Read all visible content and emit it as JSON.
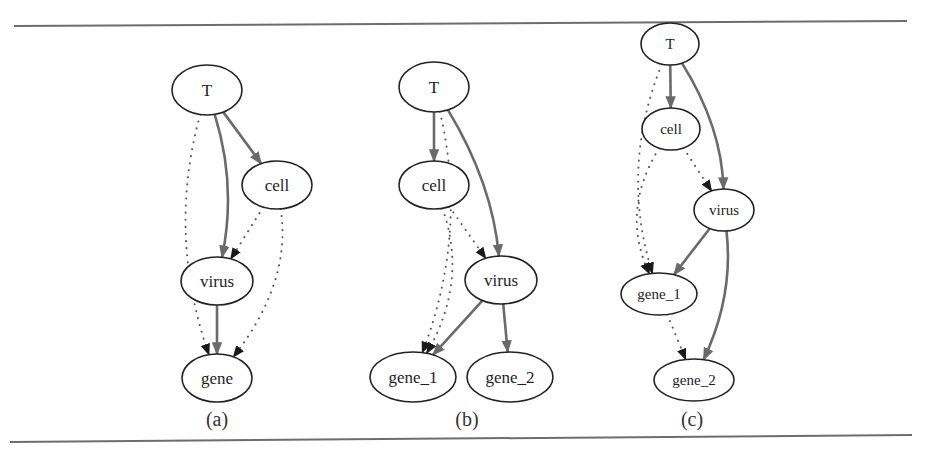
{
  "figure": {
    "panels": [
      {
        "id": "a",
        "caption": "(a)",
        "caption_pos": [
          217,
          426
        ],
        "nodes": [
          {
            "id": "T",
            "label": "T",
            "cx": 207,
            "cy": 90,
            "rx": 35,
            "ry": 25,
            "font": 17
          },
          {
            "id": "cell",
            "label": "cell",
            "cx": 277,
            "cy": 185,
            "rx": 35,
            "ry": 24,
            "font": 17
          },
          {
            "id": "virus",
            "label": "virus",
            "cx": 217,
            "cy": 281,
            "rx": 36,
            "ry": 24,
            "font": 17
          },
          {
            "id": "gene",
            "label": "gene",
            "cx": 217,
            "cy": 378,
            "rx": 35,
            "ry": 24,
            "font": 17
          }
        ],
        "edges": [
          {
            "from": "T",
            "to": "virus",
            "style": "solid"
          },
          {
            "from": "T",
            "to": "cell",
            "style": "solid"
          },
          {
            "from": "virus",
            "to": "gene",
            "style": "solid"
          },
          {
            "from": "cell",
            "to": "virus",
            "style": "dotted"
          },
          {
            "from": "T",
            "to": "gene",
            "style": "dotted"
          },
          {
            "from": "cell",
            "to": "gene",
            "style": "dotted"
          }
        ]
      },
      {
        "id": "b",
        "caption": "(b)",
        "caption_pos": [
          467,
          426
        ],
        "nodes": [
          {
            "id": "T",
            "label": "T",
            "cx": 434,
            "cy": 87,
            "rx": 35,
            "ry": 25,
            "font": 17
          },
          {
            "id": "cell",
            "label": "cell",
            "cx": 434,
            "cy": 185,
            "rx": 35,
            "ry": 24,
            "font": 17
          },
          {
            "id": "virus",
            "label": "virus",
            "cx": 501,
            "cy": 280,
            "rx": 36,
            "ry": 24,
            "font": 17
          },
          {
            "id": "gene_1",
            "label": "gene_1",
            "cx": 413,
            "cy": 377,
            "rx": 43,
            "ry": 25,
            "font": 17
          },
          {
            "id": "gene_2",
            "label": "gene_2",
            "cx": 510,
            "cy": 377,
            "rx": 43,
            "ry": 25,
            "font": 17
          }
        ],
        "edges": [
          {
            "from": "T",
            "to": "cell",
            "style": "solid"
          },
          {
            "from": "T",
            "to": "virus",
            "style": "solid"
          },
          {
            "from": "virus",
            "to": "gene_1",
            "style": "solid"
          },
          {
            "from": "virus",
            "to": "gene_2",
            "style": "solid"
          },
          {
            "from": "cell",
            "to": "virus",
            "style": "dotted"
          },
          {
            "from": "T",
            "to": "gene_1",
            "style": "dotted"
          },
          {
            "from": "cell",
            "to": "gene_1",
            "style": "dotted"
          }
        ]
      },
      {
        "id": "c",
        "caption": "(c)",
        "caption_pos": [
          692,
          426
        ],
        "nodes": [
          {
            "id": "T",
            "label": "T",
            "cx": 670,
            "cy": 44,
            "rx": 29,
            "ry": 21,
            "font": 15
          },
          {
            "id": "cell",
            "label": "cell",
            "cx": 671,
            "cy": 129,
            "rx": 29,
            "ry": 21,
            "font": 15
          },
          {
            "id": "virus",
            "label": "virus",
            "cx": 724,
            "cy": 210,
            "rx": 30,
            "ry": 21,
            "font": 15
          },
          {
            "id": "gene_1",
            "label": "gene_1",
            "cx": 659,
            "cy": 294,
            "rx": 38,
            "ry": 21,
            "font": 15
          },
          {
            "id": "gene_2",
            "label": "gene_2",
            "cx": 694,
            "cy": 380,
            "rx": 40,
            "ry": 21,
            "font": 15
          }
        ],
        "edges": [
          {
            "from": "T",
            "to": "cell",
            "style": "solid"
          },
          {
            "from": "T",
            "to": "virus",
            "style": "solid"
          },
          {
            "from": "virus",
            "to": "gene_1",
            "style": "solid"
          },
          {
            "from": "virus",
            "to": "gene_2",
            "style": "solid"
          },
          {
            "from": "cell",
            "to": "virus",
            "style": "dotted"
          },
          {
            "from": "T",
            "to": "gene_1",
            "style": "dotted"
          },
          {
            "from": "cell",
            "to": "gene_1",
            "style": "dotted"
          },
          {
            "from": "gene_1",
            "to": "gene_2",
            "style": "dotted"
          }
        ]
      }
    ],
    "rules": [
      {
        "x1": 14,
        "y1": 26,
        "x2": 907,
        "y2": 21
      },
      {
        "x1": 10,
        "y1": 442,
        "x2": 912,
        "y2": 435
      }
    ],
    "colors": {
      "solid_edge": "#6a6a6a",
      "dotted_edge": "#555555",
      "node_stroke": "#222222",
      "arrowhead": "#1a1a1a"
    }
  }
}
